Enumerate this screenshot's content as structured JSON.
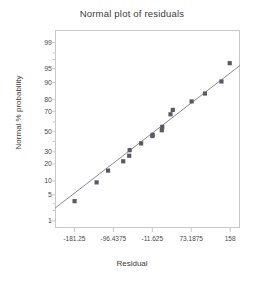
{
  "chart_data": {
    "type": "scatter",
    "title": "Normal plot of residuals",
    "xlabel": "Residual",
    "ylabel": "Normal % probability",
    "xlim": [
      -223.65,
      179.4
    ],
    "ylim_probability": [
      0.6,
      99.6
    ],
    "grid": false,
    "legend": null,
    "yscale": "normal-probability",
    "xticks": [
      -181.25,
      -96.4375,
      -11.625,
      73.1875,
      158
    ],
    "xtick_labels": [
      "-181.25",
      "-96.4375",
      "-11.625",
      "73.1875",
      "158"
    ],
    "yticks": [
      1,
      5,
      10,
      20,
      30,
      50,
      70,
      80,
      90,
      95,
      99
    ],
    "ytick_labels": [
      "1",
      "5",
      "10",
      "20",
      "30",
      "50",
      "70",
      "80",
      "90",
      "95",
      "99"
    ],
    "minor_yticks": [
      2,
      3,
      40,
      60,
      97,
      98
    ],
    "marker": "square",
    "marker_color": "#5a5a66",
    "line_color": "#8a8a92",
    "axis_color": "#c9c9c9",
    "points": [
      {
        "x": -181.0,
        "y": 3.5
      },
      {
        "x": -133.0,
        "y": 9.3
      },
      {
        "x": -108.0,
        "y": 15.5
      },
      {
        "x": -75.0,
        "y": 22.0
      },
      {
        "x": -62.0,
        "y": 26.5
      },
      {
        "x": -61.0,
        "y": 31.5
      },
      {
        "x": -36.0,
        "y": 38.0
      },
      {
        "x": -11.5,
        "y": 45.5
      },
      {
        "x": -11.0,
        "y": 46.8
      },
      {
        "x": 9.0,
        "y": 51.5
      },
      {
        "x": 10.0,
        "y": 55.0
      },
      {
        "x": 28.0,
        "y": 67.5
      },
      {
        "x": 33.0,
        "y": 71.5
      },
      {
        "x": 74.0,
        "y": 78.5
      },
      {
        "x": 103.0,
        "y": 84.0
      },
      {
        "x": 139.0,
        "y": 90.5
      },
      {
        "x": 157.0,
        "y": 96.3
      }
    ],
    "reference_line": {
      "x1": -223.65,
      "y1": 2.3,
      "x2": 179.4,
      "y2": 95.8
    }
  },
  "figure": {
    "background_color": "#ffffff",
    "width": 264,
    "height": 282
  }
}
